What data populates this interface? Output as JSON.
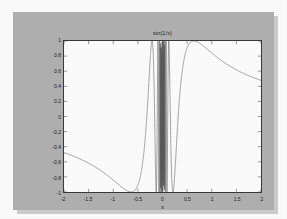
{
  "figure": {
    "title": "sin(1/x)",
    "background_color": "#b2b2b2",
    "axes_background_color": "#ffffff",
    "axes_edge_color": "#3a3a3a",
    "line_color": "#5a5a5a"
  },
  "chart_data": {
    "type": "line",
    "title": "sin(1/x)",
    "xlabel": "x",
    "ylabel": "",
    "xlim": [
      -2,
      2
    ],
    "ylim": [
      -1,
      1
    ],
    "grid": false,
    "legend": null,
    "xticks": [
      -2,
      -1.5,
      -1,
      -0.5,
      0,
      0.5,
      1,
      1.5,
      2
    ],
    "xticklabels": [
      "-2",
      "-1.5",
      "-1",
      "-0.5",
      "0",
      "0.5",
      "1",
      "1.5",
      "2"
    ],
    "yticks": [
      -1,
      -0.8,
      -0.6,
      -0.4,
      -0.2,
      0,
      0.2,
      0.4,
      0.6,
      0.8,
      1
    ],
    "yticklabels": [
      "-1",
      "-0.8",
      "-0.6",
      "-0.4",
      "-0.2",
      "0",
      "0.2",
      "0.4",
      "0.6",
      "0.8",
      "1"
    ],
    "series": [
      {
        "name": "sin(1/x)",
        "expression": "sin(1/x)",
        "n_samples": 4000,
        "x_start": -2,
        "x_end": 2,
        "description": "Smooth outer lobes peaking at y=1 near x=-0.70 and x=+0.70, decaying to about y=0.25 at x=+/-2; dense rapid oscillation filling -1..1 between about x=-0.6 and x=+0.6.",
        "sample_points": [
          {
            "x": -2.0,
            "y": 0.25
          },
          {
            "x": -1.75,
            "y": 0.29
          },
          {
            "x": -1.5,
            "y": 0.34
          },
          {
            "x": -1.25,
            "y": 0.41
          },
          {
            "x": -1.0,
            "y": 0.52
          },
          {
            "x": -0.9,
            "y": 0.64
          },
          {
            "x": -0.8,
            "y": 0.78
          },
          {
            "x": -0.7,
            "y": 0.99
          },
          {
            "x": -0.65,
            "y": 0.95
          },
          {
            "x": -0.6,
            "y": 0.72
          },
          {
            "x": -0.55,
            "y": 0.11
          },
          {
            "x": -0.5,
            "y": -0.91
          },
          {
            "x": -0.45,
            "y": -0.82
          },
          {
            "x": -0.4,
            "y": 0.6
          },
          {
            "x": -0.3,
            "y": 0.19
          },
          {
            "x": -0.2,
            "y": -0.96
          },
          {
            "x": -0.1,
            "y": -0.54
          },
          {
            "x": -0.05,
            "y": 0.91
          },
          {
            "x": 0.0,
            "y": 0.0
          },
          {
            "x": 0.05,
            "y": -0.91
          },
          {
            "x": 0.1,
            "y": 0.54
          },
          {
            "x": 0.2,
            "y": 0.96
          },
          {
            "x": 0.3,
            "y": -0.19
          },
          {
            "x": 0.4,
            "y": -0.6
          },
          {
            "x": 0.45,
            "y": 0.82
          },
          {
            "x": 0.5,
            "y": 0.91
          },
          {
            "x": 0.55,
            "y": -0.11
          },
          {
            "x": 0.6,
            "y": -0.72
          },
          {
            "x": 0.7,
            "y": 0.99
          },
          {
            "x": 0.8,
            "y": 0.78
          },
          {
            "x": 0.9,
            "y": 0.64
          },
          {
            "x": 1.0,
            "y": 0.52
          },
          {
            "x": 1.25,
            "y": 0.41
          },
          {
            "x": 1.5,
            "y": 0.34
          },
          {
            "x": 1.75,
            "y": 0.29
          },
          {
            "x": 2.0,
            "y": 0.25
          }
        ]
      }
    ]
  }
}
